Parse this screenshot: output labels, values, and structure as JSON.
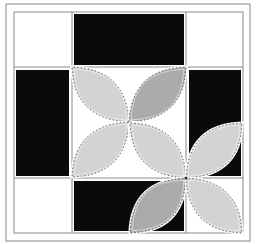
{
  "figure": {
    "colors": {
      "background": "#ffffff",
      "frame": "#9a9a9a",
      "grid_line": "#8a8a8a",
      "block_fill": "#0a0a0a",
      "petal_light": "#d3d3d3",
      "petal_dark": "#ababab",
      "stitch": "#333333"
    },
    "outer_frame": {
      "x": 6,
      "y": 4,
      "w": 244,
      "h": 237
    },
    "grid": {
      "x": [
        14,
        72,
        186,
        243
      ],
      "y": [
        12,
        67,
        178,
        233
      ]
    },
    "black_blocks": [
      {
        "name": "top-middle-block",
        "x": 74,
        "y": 14,
        "w": 110,
        "h": 51
      },
      {
        "name": "middle-left-block",
        "x": 16,
        "y": 70,
        "w": 53,
        "h": 106
      },
      {
        "name": "middle-right-block",
        "x": 189,
        "y": 70,
        "w": 52,
        "h": 106
      },
      {
        "name": "bottom-middle-block",
        "x": 74,
        "y": 181,
        "w": 110,
        "h": 50
      }
    ],
    "flowers": [
      {
        "name": "center-flower",
        "cx": 129,
        "cy": 122,
        "rx": 57,
        "ry": 55,
        "petals": [
          {
            "dir": "top-left",
            "shade": "light"
          },
          {
            "dir": "top-right",
            "shade": "dark"
          },
          {
            "dir": "bottom-left",
            "shade": "light"
          },
          {
            "dir": "bottom-right",
            "shade": "light"
          }
        ]
      },
      {
        "name": "corner-flower",
        "cx": 186,
        "cy": 178,
        "rx": 56,
        "ry": 55,
        "petals": [
          {
            "dir": "top-left",
            "shade": "light"
          },
          {
            "dir": "top-right",
            "shade": "light"
          },
          {
            "dir": "bottom-left",
            "shade": "dark"
          },
          {
            "dir": "bottom-right",
            "shade": "light"
          }
        ]
      }
    ]
  }
}
